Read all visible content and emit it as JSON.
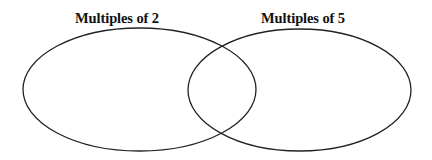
{
  "diagram": {
    "type": "venn",
    "sets": [
      {
        "id": "left",
        "label": "Multiples of 2",
        "shape": {
          "cx": 139.5,
          "cy": 89.5,
          "rx": 116.5,
          "ry": 61.5
        }
      },
      {
        "id": "right",
        "label": "Multiples of 5",
        "shape": {
          "cx": 299.5,
          "cy": 90,
          "rx": 111.5,
          "ry": 61
        }
      }
    ],
    "stroke_color": "#222222",
    "background_color": "#ffffff"
  }
}
